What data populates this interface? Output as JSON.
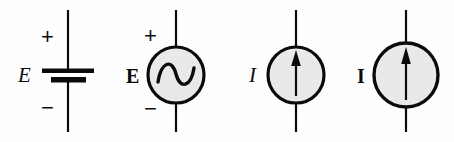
{
  "figure": {
    "background_color": "#fefefe",
    "stroke_color": "#0b0b0b",
    "fill_color": "#e9e9e9",
    "width": 454,
    "height": 142
  },
  "symbols": [
    {
      "id": "dc-voltage-source",
      "name": "DC voltage source (battery)",
      "label": "E",
      "label_style": "italic",
      "plus_sign": "+",
      "minus_sign": "−",
      "center_x": 68,
      "has_circle": false
    },
    {
      "id": "ac-voltage-source",
      "name": "AC voltage source (sinusoidal)",
      "label": "E",
      "label_style": "bold",
      "plus_sign": "+",
      "minus_sign": "−",
      "center_x": 176,
      "has_circle": true,
      "circle_radius": 28,
      "glyph": "sine-wave"
    },
    {
      "id": "current-source-instantaneous",
      "name": "Current source",
      "label": "I",
      "label_style": "italic",
      "plus_sign": "",
      "minus_sign": "",
      "center_x": 296,
      "has_circle": true,
      "circle_radius": 28,
      "glyph": "up-arrow"
    },
    {
      "id": "current-source-phasor",
      "name": "Current source (phasor)",
      "label": "I",
      "label_style": "bold",
      "plus_sign": "",
      "minus_sign": "",
      "center_x": 406,
      "has_circle": true,
      "circle_radius": 32,
      "glyph": "up-arrow"
    }
  ]
}
